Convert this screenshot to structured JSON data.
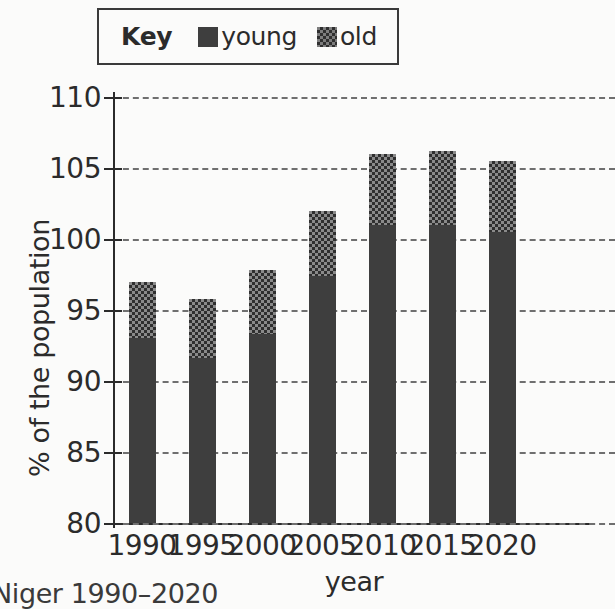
{
  "legend": {
    "title": "Key",
    "entries": [
      {
        "label": "young",
        "swatch": "solid-dark-square-icon"
      },
      {
        "label": "old",
        "swatch": "checkered-square-icon"
      }
    ]
  },
  "axes": {
    "ylabel": "% of the population",
    "xlabel": "year",
    "yticks": [
      "110",
      "105",
      "100",
      "95",
      "90",
      "85",
      "80"
    ],
    "xticks": [
      "1990",
      "1995",
      "2000",
      "2005",
      "2010",
      "2015",
      "2020"
    ]
  },
  "caption": "Niger 1990–2020",
  "colors": {
    "young": "#3e3e3e",
    "old": "#8a8a8a",
    "grid": "#6f6f6f",
    "axis": "#2b2b2b",
    "background": "#fbfbfa"
  },
  "chart_data": {
    "type": "bar",
    "title": "",
    "subtitle": "",
    "stacked": true,
    "categories": [
      "1990",
      "1995",
      "2000",
      "2005",
      "2010",
      "2015",
      "2020"
    ],
    "series": [
      {
        "name": "young",
        "values": [
          93,
          91.6,
          93.3,
          97.4,
          101,
          101,
          100.5
        ]
      },
      {
        "name": "old",
        "values": [
          4,
          4.2,
          4.5,
          4.6,
          5,
          5.2,
          5
        ]
      }
    ],
    "totals": [
      97,
      95.8,
      97.8,
      102,
      106,
      106.2,
      105.5
    ],
    "xlabel": "year",
    "ylabel": "% of the population",
    "ylim": [
      80,
      110
    ],
    "ytick_step": 5,
    "grid": true,
    "grid_style": "dashed-horizontal",
    "legend_position": "top"
  }
}
